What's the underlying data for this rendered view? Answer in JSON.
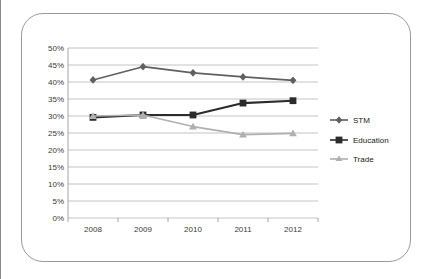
{
  "figure": {
    "frame_color": "#9a9a9a",
    "background": "#ffffff"
  },
  "chart_data": {
    "type": "line",
    "title": "",
    "subtitle": "",
    "xlabel": "",
    "ylabel": "",
    "categories": [
      "2008",
      "2009",
      "2010",
      "2011",
      "2012"
    ],
    "ylim": [
      0,
      50
    ],
    "ytick_labels": [
      "0%",
      "5%",
      "10%",
      "15%",
      "20%",
      "25%",
      "30%",
      "35%",
      "40%",
      "45%",
      "50%"
    ],
    "ytick_values": [
      0,
      5,
      10,
      15,
      20,
      25,
      30,
      35,
      40,
      45,
      50
    ],
    "grid": "horizontal",
    "legend_position": "right",
    "value_suffix": "%",
    "series": [
      {
        "name": "STM",
        "marker": "diamond",
        "color": "#606060",
        "values": [
          40.6,
          44.5,
          42.7,
          41.5,
          40.5
        ]
      },
      {
        "name": "Education",
        "marker": "square",
        "color": "#2b2b2b",
        "values": [
          29.6,
          30.3,
          30.3,
          33.8,
          34.5
        ]
      },
      {
        "name": "Trade",
        "marker": "triangle",
        "color": "#b0b0b0",
        "values": [
          30.0,
          30.3,
          26.9,
          24.5,
          24.9
        ]
      }
    ]
  },
  "axis": {
    "x_tick_color": "#9a9a9a",
    "y_axis_color": "#9a9a9a",
    "gridline_color": "#b5b5b5"
  }
}
